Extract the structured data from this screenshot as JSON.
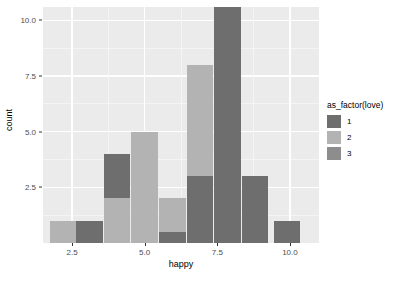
{
  "chart_data": {
    "type": "bar",
    "title": "",
    "subtitle": "",
    "xlabel": "happy",
    "ylabel": "count",
    "xlim": [
      1.5,
      11.0
    ],
    "ylim": [
      0,
      10.6
    ],
    "grid": true,
    "legend_position": "right",
    "legend_title": "as_factor(love)",
    "stacked": true,
    "binwidth": 1,
    "x_ticks": [
      {
        "label": "2.5",
        "value": 2.5
      },
      {
        "label": "5.0",
        "value": 5.0
      },
      {
        "label": "7.5",
        "value": 7.5
      },
      {
        "label": "10.0",
        "value": 10.0
      }
    ],
    "y_ticks": [
      {
        "label": "2.5",
        "value": 2.5
      },
      {
        "label": "5.0",
        "value": 5.0
      },
      {
        "label": "7.5",
        "value": 7.5
      },
      {
        "label": "10.0",
        "value": 10.0
      }
    ],
    "series": [
      {
        "name": "1",
        "color": "#6e6e6e",
        "values": [
          0,
          1,
          2,
          0.5,
          3,
          10.6,
          3,
          0
        ]
      },
      {
        "name": "2",
        "color": "#b3b3b3",
        "values": [
          1,
          0,
          2,
          1.5,
          5,
          0,
          0,
          1
        ]
      },
      {
        "name": "3",
        "color": "#8d8d8d",
        "values": [
          0,
          0,
          0,
          0,
          0,
          0,
          0,
          0
        ]
      }
    ],
    "bars": [
      {
        "x_center": 2.2,
        "total": 1,
        "segments": [
          {
            "series": "2",
            "value": 1
          }
        ]
      },
      {
        "x_center": 3.1,
        "total": 1,
        "segments": [
          {
            "series": "1",
            "value": 1
          }
        ]
      },
      {
        "x_center": 4.05,
        "total": 4,
        "segments": [
          {
            "series": "2",
            "value": 2
          },
          {
            "series": "1",
            "value": 2
          }
        ]
      },
      {
        "x_center": 5.0,
        "total": 5,
        "segments": [
          {
            "series": "2",
            "value": 5
          }
        ]
      },
      {
        "x_center": 5.95,
        "total": 2,
        "segments": [
          {
            "series": "1",
            "value": 0.5
          },
          {
            "series": "2",
            "value": 1.5
          }
        ]
      },
      {
        "x_center": 6.9,
        "total": 8,
        "segments": [
          {
            "series": "1",
            "value": 3
          },
          {
            "series": "2",
            "value": 5
          }
        ]
      },
      {
        "x_center": 7.85,
        "total": 10.6,
        "segments": [
          {
            "series": "1",
            "value": 10.6
          }
        ]
      },
      {
        "x_center": 8.8,
        "total": 3,
        "segments": [
          {
            "series": "1",
            "value": 3
          }
        ]
      },
      {
        "x_center": 9.9,
        "total": 1,
        "segments": [
          {
            "series": "1",
            "value": 1
          }
        ]
      }
    ],
    "legend_entries": [
      {
        "label": "1",
        "color": "#6e6e6e"
      },
      {
        "label": "2",
        "color": "#b3b3b3"
      },
      {
        "label": "3",
        "color": "#8d8d8d"
      }
    ],
    "panel_background": "#ebebeb",
    "gridline_color": "#ffffff"
  },
  "axes": {
    "y_title": "count",
    "x_title": "happy"
  },
  "legend": {
    "title": "as_factor(love)"
  }
}
